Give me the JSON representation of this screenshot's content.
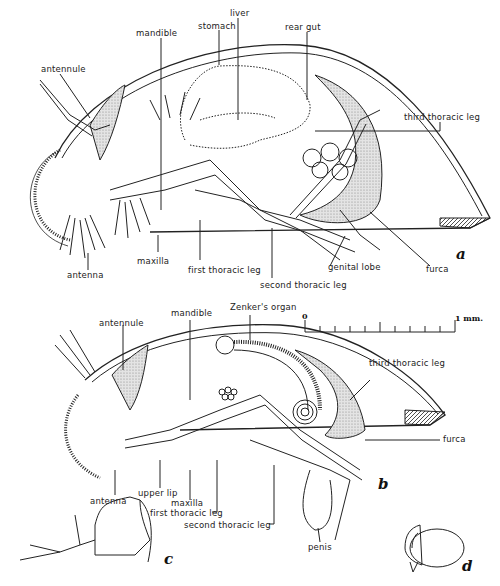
{
  "figure": {
    "panels": {
      "a": "a",
      "b": "b",
      "c": "c",
      "d": "d"
    },
    "scale_bar": {
      "start": "0",
      "end": "1 mm.",
      "ticks": 10
    },
    "panel_a": {
      "labels": {
        "antennule": "antennule",
        "mandible": "mandible",
        "stomach": "stomach",
        "liver": "liver",
        "rear_gut": "rear gut",
        "third_thoracic_leg": "third thoracic leg",
        "antenna": "antenna",
        "maxilla": "maxilla",
        "first_thoracic_leg": "first thoracic leg",
        "second_thoracic_leg": "second thoracic leg",
        "genital_lobe": "genital lobe",
        "furca": "furca"
      }
    },
    "panel_b": {
      "labels": {
        "antennule": "antennule",
        "mandible": "mandible",
        "zenkers_organ": "Zenker's organ",
        "third_thoracic_leg": "third thoracic leg",
        "furca": "furca",
        "antenna": "antenna",
        "upper_lip": "upper lip",
        "maxilla": "maxilla",
        "first_thoracic_leg": "first thoracic leg",
        "second_thoracic_leg": "second thoracic leg",
        "penis": "penis"
      }
    },
    "colors": {
      "ink": "#222222",
      "stipple": "#bdbdbd",
      "paper": "#ffffff"
    }
  }
}
